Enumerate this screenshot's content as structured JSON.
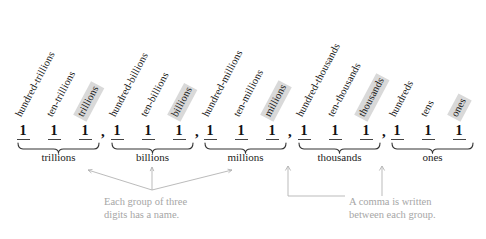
{
  "figure": {
    "highlight_color": "#d9d9d9",
    "annotation_color": "#a6a6a6",
    "digit": "1",
    "comma": ","
  },
  "place_labels": [
    {
      "text": "hundred-trillions",
      "highlighted": false,
      "x": 24,
      "y": 119
    },
    {
      "text": "ten-trillions",
      "highlighted": false,
      "x": 55,
      "y": 119
    },
    {
      "text": "trillions",
      "highlighted": true,
      "x": 86,
      "y": 119
    },
    {
      "text": "hundred-billions",
      "highlighted": false,
      "x": 118,
      "y": 119
    },
    {
      "text": "ten-billions",
      "highlighted": false,
      "x": 149,
      "y": 119
    },
    {
      "text": "billions",
      "highlighted": true,
      "x": 180,
      "y": 119
    },
    {
      "text": "hundred-millions",
      "highlighted": false,
      "x": 211,
      "y": 119
    },
    {
      "text": "ten-millions",
      "highlighted": false,
      "x": 242,
      "y": 119
    },
    {
      "text": "millions",
      "highlighted": true,
      "x": 273,
      "y": 119
    },
    {
      "text": "hundred-thousands",
      "highlighted": false,
      "x": 305,
      "y": 119
    },
    {
      "text": "ten-thousands",
      "highlighted": false,
      "x": 336,
      "y": 119
    },
    {
      "text": "thousands",
      "highlighted": true,
      "x": 367,
      "y": 119
    },
    {
      "text": "hundreds",
      "highlighted": false,
      "x": 398,
      "y": 119
    },
    {
      "text": "tens",
      "highlighted": false,
      "x": 429,
      "y": 119
    },
    {
      "text": "ones",
      "highlighted": true,
      "x": 460,
      "y": 119
    }
  ],
  "digits": [
    {
      "value": "1",
      "x": 23
    },
    {
      "value": "1",
      "x": 54
    },
    {
      "value": "1",
      "x": 85
    },
    {
      "value": "1",
      "x": 117
    },
    {
      "value": "1",
      "x": 148
    },
    {
      "value": "1",
      "x": 179
    },
    {
      "value": "1",
      "x": 210
    },
    {
      "value": "1",
      "x": 241
    },
    {
      "value": "1",
      "x": 272
    },
    {
      "value": "1",
      "x": 304
    },
    {
      "value": "1",
      "x": 335
    },
    {
      "value": "1",
      "x": 366
    },
    {
      "value": "1",
      "x": 397
    },
    {
      "value": "1",
      "x": 428
    },
    {
      "value": "1",
      "x": 459
    }
  ],
  "commas": [
    {
      "value": ",",
      "x": 101
    },
    {
      "value": ",",
      "x": 195
    },
    {
      "value": ",",
      "x": 288
    },
    {
      "value": ",",
      "x": 382
    }
  ],
  "groups": [
    {
      "name": "trillions",
      "left": 18,
      "right": 99,
      "center": 58.5
    },
    {
      "name": "billions",
      "left": 112,
      "right": 193,
      "center": 152.5
    },
    {
      "name": "millions",
      "left": 205,
      "right": 286,
      "center": 245.5
    },
    {
      "name": "thousands",
      "left": 299,
      "right": 380,
      "center": 339.5
    },
    {
      "name": "ones",
      "left": 392,
      "right": 473,
      "center": 432.5
    }
  ],
  "annotations": [
    {
      "id": "group-name-note",
      "line1": "Each group of three",
      "line2": "digits has a name.",
      "x": 104,
      "y": 196
    },
    {
      "id": "comma-note",
      "line1": "A comma is written",
      "line2": "between each group.",
      "x": 349,
      "y": 196
    }
  ]
}
